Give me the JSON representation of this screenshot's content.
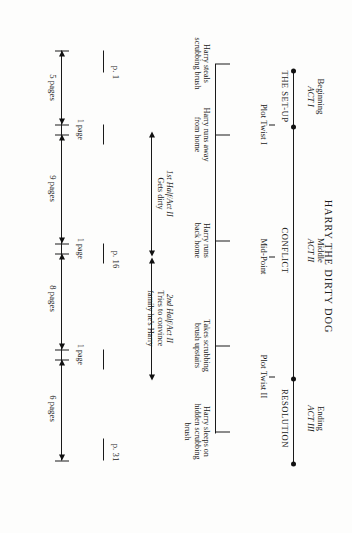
{
  "document": {
    "title": "HARRY THE DIRTY DOG",
    "type": "story-structure-beat-sheet"
  },
  "acts": [
    {
      "stage": "Beginning",
      "act": "ACT I",
      "section": "THE SET-UP"
    },
    {
      "stage": "Middle",
      "act": "ACT II",
      "section": "CONFLICT"
    },
    {
      "stage": "Ending",
      "act": "ACT III",
      "section": "RESOLUTION"
    }
  ],
  "plot_points": [
    {
      "label": "Plot Twist I"
    },
    {
      "label": "Mid-Point"
    },
    {
      "label": "Plot Twist II"
    }
  ],
  "act2_halves": [
    {
      "label": "1st Half/Act II",
      "detail": "Gets dirty"
    },
    {
      "label": "2nd Half/Act II",
      "detail": "Tries to convince\nfamily he's Harry"
    }
  ],
  "beats": [
    {
      "line1": "Harry steals",
      "line2": "scrubbing brush"
    },
    {
      "line1": "Harry runs away",
      "line2": "from home"
    },
    {
      "line1": "Harry runs",
      "line2": "back home"
    },
    {
      "line1": "Takes scrubbing",
      "line2": "brush upstairs"
    },
    {
      "line1": "Harry sleeps on",
      "line2": "hidden scrubbing",
      "line3": "brush"
    }
  ],
  "page_markers": [
    {
      "label": "p. 1"
    },
    {
      "label": "p. 16"
    },
    {
      "label": "p. 31"
    }
  ],
  "page_spans": [
    {
      "label": "5 pages"
    },
    {
      "label": "1 page"
    },
    {
      "label": "9 pages"
    },
    {
      "label": "1 page"
    },
    {
      "label": "8 pages"
    },
    {
      "label": "1 page"
    },
    {
      "label": "6 pages"
    }
  ],
  "colors": {
    "ink": "#1a1a1a",
    "paper": "#fdfdfc"
  }
}
